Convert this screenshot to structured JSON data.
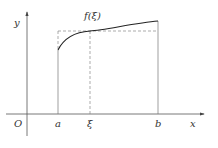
{
  "diagram": {
    "type": "mean-value-theorem-integral",
    "labels": {
      "y_axis": "y",
      "x_axis": "x",
      "origin": "O",
      "a": "a",
      "xi": "ξ",
      "b": "b",
      "curve": "f(ξ)"
    },
    "colors": {
      "axis": "#555555",
      "curve": "#222222",
      "dash": "#888888",
      "background": "#ffffff"
    }
  }
}
